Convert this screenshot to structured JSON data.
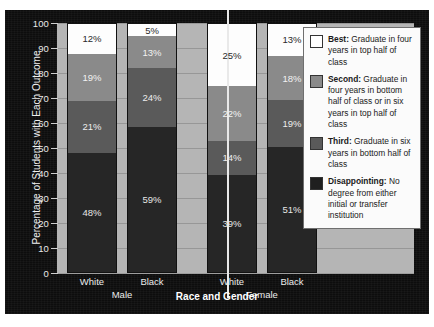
{
  "chart_data": {
    "type": "bar",
    "subtype": "stacked-bar-100",
    "title": "",
    "xlabel": "Race and Gender",
    "ylabel": "Percentage of Students with Each Outcome",
    "ylim": [
      0,
      100
    ],
    "ytick_step": 10,
    "yticks": [
      "100",
      "90",
      "80",
      "70",
      "60",
      "50",
      "40",
      "30",
      "20",
      "10",
      "0"
    ],
    "grid": true,
    "legend_position": "right-inside",
    "categories": [
      "White",
      "Black",
      "White",
      "Black"
    ],
    "groups": [
      {
        "label": "Male",
        "categories": [
          "White",
          "Black"
        ]
      },
      {
        "label": "Female",
        "categories": [
          "White",
          "Black"
        ]
      }
    ],
    "series": [
      {
        "name": "Disappointing",
        "values": [
          48,
          59,
          39,
          51
        ],
        "color": "#262626"
      },
      {
        "name": "Third",
        "values": [
          21,
          24,
          14,
          19
        ],
        "color": "#5a5a5a"
      },
      {
        "name": "Second",
        "values": [
          19,
          13,
          22,
          18
        ],
        "color": "#8a8a8a"
      },
      {
        "name": "Best",
        "values": [
          12,
          5,
          25,
          13
        ],
        "color": "#ffffff"
      }
    ],
    "bars": [
      {
        "group": "Male",
        "category": "White",
        "segments": [
          {
            "series": "Disappointing",
            "value": 48,
            "label": "48%"
          },
          {
            "series": "Third",
            "value": 21,
            "label": "21%"
          },
          {
            "series": "Second",
            "value": 19,
            "label": "19%"
          },
          {
            "series": "Best",
            "value": 12,
            "label": "12%"
          }
        ]
      },
      {
        "group": "Male",
        "category": "Black",
        "segments": [
          {
            "series": "Disappointing",
            "value": 59,
            "label": "59%"
          },
          {
            "series": "Third",
            "value": 24,
            "label": "24%"
          },
          {
            "series": "Second",
            "value": 13,
            "label": "13%"
          },
          {
            "series": "Best",
            "value": 5,
            "label": "5%"
          }
        ]
      },
      {
        "group": "Female",
        "category": "White",
        "segments": [
          {
            "series": "Disappointing",
            "value": 39,
            "label": "39%"
          },
          {
            "series": "Third",
            "value": 14,
            "label": "14%"
          },
          {
            "series": "Second",
            "value": 22,
            "label": "22%"
          },
          {
            "series": "Best",
            "value": 25,
            "label": "25%"
          }
        ]
      },
      {
        "group": "Female",
        "category": "Black",
        "segments": [
          {
            "series": "Disappointing",
            "value": 51,
            "label": "51%"
          },
          {
            "series": "Third",
            "value": 19,
            "label": "19%"
          },
          {
            "series": "Second",
            "value": 18,
            "label": "18%"
          },
          {
            "series": "Best",
            "value": 13,
            "label": "13%"
          }
        ]
      }
    ],
    "legend": [
      {
        "swatch": "best",
        "term": "Best:",
        "text": " Graduate in four years in top half of class"
      },
      {
        "swatch": "second",
        "term": "Second:",
        "text": " Graduate in four years in bottom half of class or in six years in top half of class"
      },
      {
        "swatch": "third",
        "term": "Third:",
        "text": " Graduate in six years in bottom half of class"
      },
      {
        "swatch": "disap",
        "term": "Disappointing:",
        "text": " No degree from either initial or transfer institution"
      }
    ]
  },
  "axis": {
    "y_title": "Percentage of Students with Each Outcome",
    "x_title": "Race and Gender",
    "y_ticks": [
      "100",
      "90",
      "80",
      "70",
      "60",
      "50",
      "40",
      "30",
      "20",
      "10",
      "0"
    ]
  },
  "labels": {
    "cat_male_white": "White",
    "cat_male_black": "Black",
    "cat_female_white": "White",
    "cat_female_black": "Black",
    "group_male": "Male",
    "group_female": "Female"
  },
  "colors": {
    "best": "#ffffff",
    "second": "#8a8a8a",
    "third": "#5a5a5a",
    "disappointing": "#262626",
    "plot_background": "#b5b5b5",
    "frame_background": "#0d0d0d",
    "legend_background": "#fbfbfb"
  }
}
